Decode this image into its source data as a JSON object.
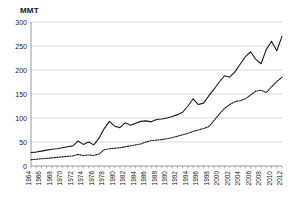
{
  "axis_unit_label": "MMT",
  "colors": {
    "series_primary": "#1a1a1a",
    "series_secondary": "#1a1a1a",
    "gridline": "#c8c8c8",
    "axis": "#808080",
    "background": "#ffffff"
  },
  "chart_data": {
    "type": "line",
    "title": "",
    "subtitle": "",
    "xlabel": "",
    "ylabel": "MMT",
    "ylim": [
      0,
      300
    ],
    "ytick_values": [
      0,
      50,
      100,
      150,
      200,
      250,
      300
    ],
    "ytick_labels": [
      "0",
      "50",
      "100",
      "150",
      "200",
      "250",
      "300"
    ],
    "grid": true,
    "legend": "none",
    "xlim": [
      1964,
      2012
    ],
    "x": [
      1964,
      1965,
      1966,
      1967,
      1968,
      1969,
      1970,
      1971,
      1972,
      1973,
      1974,
      1975,
      1976,
      1977,
      1978,
      1979,
      1980,
      1981,
      1982,
      1983,
      1984,
      1985,
      1986,
      1987,
      1988,
      1989,
      1990,
      1991,
      1992,
      1993,
      1994,
      1995,
      1996,
      1997,
      1998,
      1999,
      2000,
      2001,
      2002,
      2003,
      2004,
      2005,
      2006,
      2007,
      2008,
      2009,
      2010,
      2011,
      2012
    ],
    "xtick_labels": [
      "1964",
      "1966",
      "1968",
      "1970",
      "1972",
      "1974",
      "1976",
      "1978",
      "1980",
      "1982",
      "1984",
      "1986",
      "1988",
      "1990",
      "1992",
      "1994",
      "1996",
      "1998",
      "2000",
      "2002",
      "2004",
      "2006",
      "2008",
      "2010",
      "2012"
    ],
    "xtick_values": [
      1964,
      1966,
      1968,
      1970,
      1972,
      1974,
      1976,
      1978,
      1980,
      1982,
      1984,
      1986,
      1988,
      1990,
      1992,
      1994,
      1996,
      1998,
      2000,
      2002,
      2004,
      2006,
      2008,
      2010,
      2012
    ],
    "series": [
      {
        "name": "series-solid",
        "style": "solid",
        "values": [
          28,
          29,
          31,
          33,
          35,
          36,
          38,
          40,
          42,
          52,
          45,
          50,
          44,
          58,
          78,
          93,
          83,
          80,
          90,
          85,
          89,
          93,
          94,
          92,
          97,
          98,
          100,
          103,
          107,
          112,
          125,
          140,
          128,
          131,
          146,
          160,
          175,
          188,
          185,
          196,
          212,
          228,
          238,
          222,
          213,
          243,
          260,
          240,
          270
        ]
      },
      {
        "name": "series-dotted",
        "style": "dotted",
        "values": [
          13,
          14,
          15,
          16,
          17,
          18,
          19,
          20,
          21,
          24,
          22,
          23,
          22,
          25,
          34,
          36,
          37,
          38,
          40,
          42,
          44,
          46,
          50,
          53,
          54,
          55,
          57,
          59,
          62,
          65,
          68,
          72,
          75,
          78,
          82,
          95,
          108,
          120,
          128,
          134,
          136,
          140,
          148,
          156,
          158,
          153,
          165,
          176,
          185
        ]
      }
    ]
  }
}
